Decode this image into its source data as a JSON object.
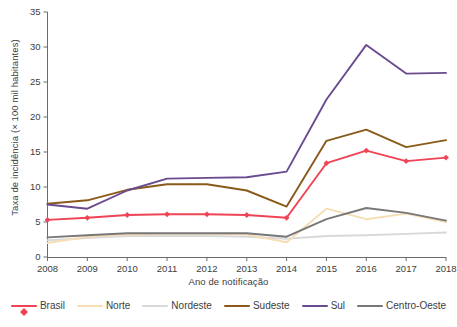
{
  "chart_data": {
    "type": "line",
    "title": "",
    "xlabel": "Ano de notificação",
    "ylabel": "Taxa de incidência (× 100 mil habitantes)",
    "x": [
      2008,
      2009,
      2010,
      2011,
      2012,
      2013,
      2014,
      2015,
      2016,
      2017,
      2018
    ],
    "xtick_labels": [
      "2008",
      "2009",
      "2010",
      "2011",
      "2012",
      "2013",
      "2014",
      "2015",
      "2016",
      "2017",
      "2018"
    ],
    "ytick_labels": [
      "0",
      "5",
      "10",
      "15",
      "20",
      "25",
      "30",
      "35"
    ],
    "ytick_values": [
      0,
      5,
      10,
      15,
      20,
      25,
      30,
      35
    ],
    "ylim": [
      0,
      35
    ],
    "xlim": [
      2008,
      2018
    ],
    "grid": false,
    "legend_position": "bottom",
    "series": [
      {
        "name": "Brasil",
        "color": "#ef4356",
        "marker": "diamond",
        "values": [
          5.3,
          5.6,
          6.0,
          6.1,
          6.1,
          6.0,
          5.6,
          13.4,
          15.2,
          13.7,
          14.2
        ]
      },
      {
        "name": "Norte",
        "color": "#f6ddb5",
        "marker": "none",
        "values": [
          2.0,
          2.9,
          3.2,
          3.3,
          3.3,
          3.2,
          2.1,
          6.9,
          5.4,
          6.2,
          5.0
        ]
      },
      {
        "name": "Nordeste",
        "color": "#d9d9d9",
        "marker": "none",
        "values": [
          2.4,
          2.7,
          3.0,
          3.0,
          3.0,
          2.9,
          2.6,
          3.0,
          3.1,
          3.3,
          3.5
        ]
      },
      {
        "name": "Sudeste",
        "color": "#8a5a1a",
        "marker": "none",
        "values": [
          7.6,
          8.1,
          9.6,
          10.4,
          10.4,
          9.5,
          7.2,
          16.6,
          18.2,
          15.7,
          16.7
        ]
      },
      {
        "name": "Sul",
        "color": "#6b4b8f",
        "marker": "none",
        "values": [
          7.5,
          6.9,
          9.5,
          11.2,
          11.3,
          11.4,
          12.2,
          22.5,
          30.3,
          26.2,
          26.3
        ]
      },
      {
        "name": "Centro-Oeste",
        "color": "#777777",
        "marker": "none",
        "values": [
          2.8,
          3.1,
          3.4,
          3.4,
          3.4,
          3.4,
          2.9,
          5.4,
          7.0,
          6.3,
          5.2
        ]
      }
    ]
  },
  "legend": {
    "items": [
      {
        "label": "Brasil"
      },
      {
        "label": "Norte"
      },
      {
        "label": "Nordeste"
      },
      {
        "label": "Sudeste"
      },
      {
        "label": "Sul"
      },
      {
        "label": "Centro-Oeste"
      }
    ]
  },
  "axes": {
    "x_title": "Ano de notificação",
    "y_title": "Taxa de incidência (× 100 mil habitantes)"
  }
}
